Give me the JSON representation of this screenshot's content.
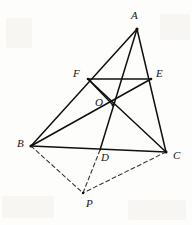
{
  "figure": {
    "canvas": {
      "width": 192,
      "height": 225
    },
    "stroke_color": "#101010",
    "dashed_color": "#3a3a3a",
    "background_color": "#fdfdfb",
    "points": {
      "A": {
        "x": 137,
        "y": 29,
        "label": "A",
        "label_x": 131,
        "label_y": 10
      },
      "B": {
        "x": 31,
        "y": 146,
        "label": "B",
        "label_x": 17,
        "label_y": 138
      },
      "C": {
        "x": 166,
        "y": 152,
        "label": "C",
        "label_x": 173,
        "label_y": 150
      },
      "D": {
        "x": 100,
        "y": 150,
        "label": "D",
        "label_x": 101,
        "label_y": 152
      },
      "E": {
        "x": 151,
        "y": 79,
        "label": "E",
        "label_x": 156,
        "label_y": 68
      },
      "F": {
        "x": 88,
        "y": 79,
        "label": "F",
        "label_x": 73,
        "label_y": 68
      },
      "O": {
        "x": 113,
        "y": 105,
        "label": "O",
        "label_x": 95,
        "label_y": 97
      },
      "P": {
        "x": 83,
        "y": 193,
        "label": "P",
        "label_x": 86,
        "label_y": 198
      }
    },
    "solid_segments": [
      {
        "name": "side-AB",
        "from": "A",
        "to": "B"
      },
      {
        "name": "side-BC",
        "from": "B",
        "to": "C"
      },
      {
        "name": "side-CA",
        "from": "C",
        "to": "A"
      },
      {
        "name": "cevian-AD",
        "from": "A",
        "to": "D"
      },
      {
        "name": "cevian-BE",
        "from": "B",
        "to": "E"
      },
      {
        "name": "cevian-CF",
        "from": "C",
        "to": "F"
      },
      {
        "name": "midsegment-FE",
        "from": "F",
        "to": "E"
      },
      {
        "name": "segment-FO",
        "from": "F",
        "to": "O"
      }
    ],
    "dashed_segments": [
      {
        "name": "dashed-BP",
        "from": "B",
        "to": "P"
      },
      {
        "name": "dashed-CP",
        "from": "C",
        "to": "P"
      },
      {
        "name": "dashed-DP",
        "from": "D",
        "to": "P"
      }
    ],
    "labels": [
      {
        "id": "label-A",
        "text": "A"
      },
      {
        "id": "label-B",
        "text": "B"
      },
      {
        "id": "label-C",
        "text": "C"
      },
      {
        "id": "label-D",
        "text": "D"
      },
      {
        "id": "label-E",
        "text": "E"
      },
      {
        "id": "label-F",
        "text": "F"
      },
      {
        "id": "label-O",
        "text": "O"
      },
      {
        "id": "label-P",
        "text": "P"
      }
    ]
  }
}
